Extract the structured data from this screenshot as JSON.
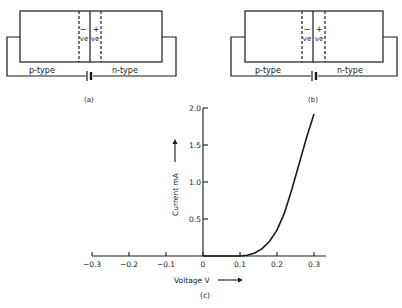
{
  "panels": [
    {
      "id": "a",
      "caption": "(a)",
      "left_label": "p-type",
      "right_label": "n-type",
      "neg_sign": "−",
      "pos_sign": "+",
      "neg_label": "ve",
      "pos_label": "ve"
    },
    {
      "id": "b",
      "caption": "(b)",
      "left_label": "p-type",
      "right_label": "n-type",
      "neg_sign": "−",
      "pos_sign": "+",
      "neg_label": "ve",
      "pos_label": "ve"
    }
  ],
  "chart_data": {
    "type": "line",
    "caption": "(c)",
    "title": "",
    "xlabel": "Voltage V",
    "ylabel": "Current mA",
    "x_ticks": [
      "−0.3",
      "−0.2",
      "−0.1",
      "0",
      "0.1",
      "0.2",
      "0.3"
    ],
    "y_ticks": [
      "0.5",
      "1.0",
      "1.5",
      "2.0"
    ],
    "xlim": [
      -0.3,
      0.3
    ],
    "ylim": [
      0,
      2.0
    ],
    "grid": false,
    "series": [
      {
        "name": "diode forward characteristic",
        "x": [
          0.0,
          0.05,
          0.1,
          0.12,
          0.14,
          0.16,
          0.18,
          0.2,
          0.22,
          0.24,
          0.26,
          0.28,
          0.3
        ],
        "y": [
          0.0,
          0.0,
          0.0,
          0.01,
          0.04,
          0.1,
          0.2,
          0.35,
          0.58,
          0.9,
          1.25,
          1.6,
          1.92
        ]
      }
    ]
  }
}
